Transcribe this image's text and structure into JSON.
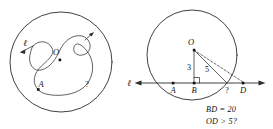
{
  "figures": [
    {
      "id": "left-figure",
      "name": "circle-with-s-curve",
      "circle_label": "",
      "labels": {
        "line_label": "ℓ",
        "center_label": "O",
        "point_a": "A",
        "unknown": "?"
      }
    },
    {
      "id": "right-figure",
      "name": "circle-with-secant-line",
      "labels": {
        "line_label": "ℓ",
        "center_label": "O",
        "point_a": "A",
        "point_b": "B",
        "point_d": "D",
        "unknown": "?",
        "segment_ob": "3",
        "segment_oc": "5"
      },
      "captions": [
        "BD = 20",
        "OD > 5?"
      ]
    }
  ],
  "colors": {
    "ink": "#2b2b2b",
    "dot": "#111111",
    "background": "#ffffff"
  }
}
